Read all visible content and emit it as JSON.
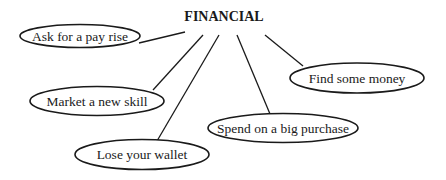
{
  "diagram": {
    "title": "FINANCIAL",
    "colors": {
      "stroke": "#1a1a1a",
      "background": "#ffffff",
      "text": "#1a1a1a"
    },
    "nodes": [
      {
        "id": "pay-rise",
        "label": "Ask for a pay rise"
      },
      {
        "id": "new-skill",
        "label": "Market a new skill"
      },
      {
        "id": "lose-wallet",
        "label": "Lose your wallet"
      },
      {
        "id": "big-purchase",
        "label": "Spend on a big purchase"
      },
      {
        "id": "find-money",
        "label": "Find some money"
      }
    ]
  }
}
